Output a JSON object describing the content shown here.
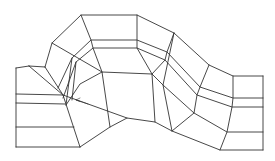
{
  "diagram": {
    "type": "curved-channel-mesh",
    "stroke_color": "#333333",
    "stroke_width": 0.9,
    "background": "#ffffff",
    "rows": [
      {
        "name": "top-boundary",
        "points": [
          [
            45,
            67
          ],
          [
            52,
            43
          ],
          [
            81,
            15
          ],
          [
            137,
            15
          ],
          [
            174,
            33
          ],
          [
            209,
            65
          ],
          [
            233,
            76
          ],
          [
            263,
            76
          ]
        ]
      },
      {
        "name": "row-1",
        "points": [
          [
            58,
            88
          ],
          [
            72,
            58
          ],
          [
            91,
            40
          ],
          [
            137,
            40
          ],
          [
            167,
            52
          ],
          [
            200,
            87
          ],
          [
            233,
            98
          ],
          [
            263,
            98
          ]
        ]
      },
      {
        "name": "row-2",
        "points": [
          [
            63,
            98
          ],
          [
            76,
            62
          ],
          [
            93,
            48
          ],
          [
            137,
            48
          ],
          [
            165,
            60
          ],
          [
            197,
            95
          ],
          [
            232,
            107
          ],
          [
            263,
            107
          ]
        ]
      },
      {
        "name": "row-3",
        "points": [
          [
            66,
            105
          ],
          [
            80,
            84
          ],
          [
            102,
            72
          ],
          [
            152,
            74
          ],
          [
            163,
            85
          ],
          [
            194,
            113
          ],
          [
            227,
            132
          ],
          [
            263,
            132
          ]
        ]
      },
      {
        "name": "bottom-boundary",
        "points": [
          [
            80,
            147
          ],
          [
            110,
            127
          ],
          [
            127,
            118
          ],
          [
            155,
            122
          ],
          [
            172,
            131
          ],
          [
            220,
            150
          ],
          [
            263,
            150
          ]
        ]
      }
    ],
    "columns": [
      {
        "name": "left-box-left",
        "points": [
          [
            16,
            68
          ],
          [
            16,
            147
          ]
        ]
      },
      {
        "name": "left-box-top",
        "points": [
          [
            16,
            68
          ],
          [
            29,
            66
          ]
        ]
      },
      {
        "name": "left-box-bottom",
        "points": [
          [
            16,
            147
          ],
          [
            80,
            147
          ]
        ]
      },
      {
        "name": "left-h1",
        "points": [
          [
            16,
            94
          ],
          [
            63,
            95
          ]
        ]
      },
      {
        "name": "left-h2",
        "points": [
          [
            16,
            103
          ],
          [
            65,
            104
          ]
        ]
      },
      {
        "name": "left-h3",
        "points": [
          [
            16,
            127
          ],
          [
            74,
            127
          ]
        ]
      },
      {
        "name": "diag-outer",
        "points": [
          [
            29,
            66
          ],
          [
            63,
            95
          ],
          [
            80,
            147
          ]
        ]
      },
      {
        "name": "diag-inner",
        "points": [
          [
            29,
            66
          ],
          [
            45,
            67
          ]
        ]
      },
      {
        "name": "col-a",
        "points": [
          [
            45,
            67
          ],
          [
            63,
            95
          ]
        ]
      },
      {
        "name": "col-b",
        "points": [
          [
            52,
            43
          ],
          [
            102,
            72
          ]
        ]
      },
      {
        "name": "col-c",
        "points": [
          [
            81,
            15
          ],
          [
            91,
            40
          ],
          [
            93,
            48
          ],
          [
            102,
            72
          ],
          [
            110,
            127
          ]
        ]
      },
      {
        "name": "col-d",
        "points": [
          [
            137,
            15
          ],
          [
            137,
            40
          ],
          [
            137,
            48
          ],
          [
            152,
            74
          ],
          [
            155,
            122
          ]
        ]
      },
      {
        "name": "col-e",
        "points": [
          [
            174,
            33
          ],
          [
            167,
            52
          ],
          [
            165,
            60
          ],
          [
            152,
            74
          ]
        ]
      },
      {
        "name": "col-f",
        "points": [
          [
            174,
            33
          ],
          [
            163,
            85
          ],
          [
            172,
            131
          ]
        ]
      },
      {
        "name": "col-g",
        "points": [
          [
            209,
            65
          ],
          [
            200,
            87
          ],
          [
            197,
            95
          ],
          [
            194,
            113
          ],
          [
            172,
            131
          ]
        ]
      },
      {
        "name": "col-h",
        "points": [
          [
            233,
            76
          ],
          [
            233,
            98
          ],
          [
            232,
            107
          ],
          [
            227,
            132
          ],
          [
            220,
            150
          ]
        ]
      },
      {
        "name": "right-box-right",
        "points": [
          [
            263,
            76
          ],
          [
            263,
            150
          ]
        ]
      },
      {
        "name": "inner-ring-1",
        "points": [
          [
            72,
            58
          ],
          [
            66,
            105
          ]
        ]
      },
      {
        "name": "inner-ring-2",
        "points": [
          [
            76,
            62
          ],
          [
            72,
            100
          ]
        ]
      },
      {
        "name": "inner-diag",
        "points": [
          [
            63,
            95
          ],
          [
            127,
            118
          ]
        ]
      }
    ],
    "arrow": {
      "name": "small-arrow",
      "from": [
        88,
        104
      ],
      "to": [
        76,
        100
      ]
    }
  }
}
